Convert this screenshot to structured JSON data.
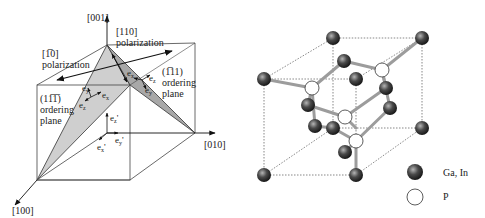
{
  "left_figure": {
    "axes": {
      "z": "[001]",
      "y": "[010]",
      "x": "[100]"
    },
    "polarization_110": {
      "direction": "[110]",
      "label": "polarization"
    },
    "polarization_1bar10": {
      "direction": "[1̅0]",
      "label": "polarization"
    },
    "plane_left": {
      "index": "(11̅1̅)",
      "line1": "ordering",
      "line2": "plane"
    },
    "plane_right": {
      "index": "(1̅11)",
      "line1": "ordering",
      "line2": "plane"
    },
    "local_axes": {
      "left": {
        "ex": "e",
        "ey": "e",
        "ez": "e",
        "ex_sub": "x",
        "ey_sub": "y",
        "ez_sub": "z"
      },
      "right": {
        "ex_sub": "x",
        "ey_sub": "y",
        "ez_sub": "z"
      },
      "primed": {
        "ex": "e",
        "ey": "e",
        "ez": "e",
        "ex_sub": "x",
        "ey_sub": "y",
        "ez_sub": "z",
        "prime": "'"
      }
    },
    "colors": {
      "plane_fill": "#c8c8c8",
      "line": "#333333"
    }
  },
  "right_figure": {
    "legend": [
      {
        "symbol": "filled-sphere",
        "label": "Ga, In"
      },
      {
        "symbol": "open-circle",
        "label": "P"
      }
    ],
    "colors": {
      "sphere_dark": "#2a2a2a",
      "sphere_light": "#9a9a9a",
      "bond": "#a0a0a0",
      "open_fill": "#ffffff"
    }
  }
}
